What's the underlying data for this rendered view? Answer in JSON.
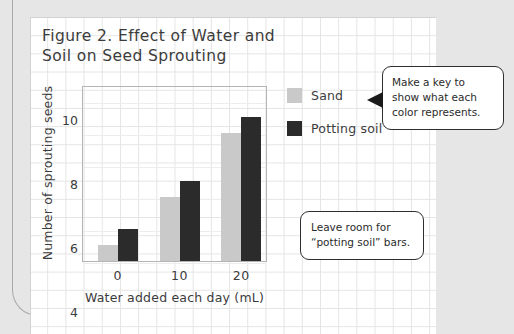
{
  "figure": {
    "title": "Figure 2. Effect of Water and\nSoil on Seed Sprouting"
  },
  "chart_data": {
    "type": "bar",
    "title": "Figure 2. Effect of Water and Soil on Seed Sprouting",
    "categories": [
      "0",
      "10",
      "20"
    ],
    "series": [
      {
        "name": "Sand",
        "values": [
          1,
          4,
          8
        ],
        "color": "#c9c9c9"
      },
      {
        "name": "Potting soil",
        "values": [
          2,
          5,
          9
        ],
        "color": "#2b2b2b"
      }
    ],
    "xlabel": "Water added each day (mL)",
    "ylabel": "Number of sprouting seeds",
    "yticks": [
      0,
      2,
      4,
      6,
      8,
      10
    ],
    "ylim": [
      0,
      11
    ],
    "grid": true,
    "legend_position": "right"
  },
  "legend": {
    "items": [
      {
        "label": "Sand",
        "color": "#c9c9c9"
      },
      {
        "label": "Potting soil",
        "color": "#2b2b2b"
      }
    ]
  },
  "callouts": [
    {
      "id": "key",
      "text": "Make a key to\nshow what each\ncolor represents."
    },
    {
      "id": "room",
      "text": "Leave room for\n“potting soil” bars."
    }
  ],
  "colors": {
    "sand": "#c9c9c9",
    "potting_soil": "#2b2b2b",
    "page_background": "#e6e6e6",
    "card_background": "#ffffff",
    "grid_line": "#e4e4e4",
    "text": "#3c3c3c",
    "callout_border": "#2e2e2e"
  }
}
